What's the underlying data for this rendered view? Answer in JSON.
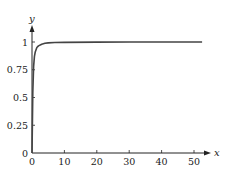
{
  "chart_data": {
    "type": "line",
    "title": "",
    "xlabel": "x",
    "ylabel": "y",
    "xlim": [
      0,
      53
    ],
    "ylim": [
      0,
      1.1
    ],
    "grid": false,
    "legend": null,
    "x_ticks": [
      0,
      10,
      20,
      30,
      40,
      50
    ],
    "x_tick_labels": [
      "0",
      "10",
      "20",
      "30",
      "40",
      "50"
    ],
    "y_ticks": [
      0,
      0.25,
      0.5,
      0.75,
      1
    ],
    "y_tick_labels": [
      "0",
      "0.25",
      "0.5",
      "0.75",
      "1"
    ],
    "series": [
      {
        "name": "curve",
        "color": "#444444",
        "x": [
          0,
          0.25,
          0.5,
          0.75,
          1,
          1.5,
          2,
          3,
          4,
          5,
          7,
          10,
          20,
          30,
          40,
          50,
          52.5
        ],
        "y": [
          0,
          0.55,
          0.78,
          0.87,
          0.91,
          0.95,
          0.965,
          0.98,
          0.988,
          0.992,
          0.995,
          0.997,
          0.999,
          1.0,
          1.0,
          1.0,
          1.0
        ]
      }
    ]
  },
  "layout": {
    "origin_px": [
      32,
      153
    ],
    "x_scale_px_per_unit": 3.24,
    "y_scale_px_per_unit": 111
  }
}
